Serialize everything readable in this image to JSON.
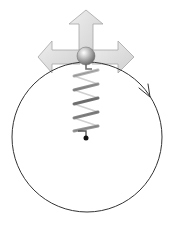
{
  "diagram": {
    "type": "physics-illustration",
    "description_elements": [
      "circular-path",
      "direction-arrowhead",
      "up-arrow",
      "left-arrow",
      "right-arrow",
      "ball",
      "spring",
      "anchor-point"
    ],
    "circle": {
      "cx": 87,
      "cy": 137,
      "r": 75,
      "stroke": "#333333",
      "direction": "clockwise"
    },
    "direction_arrowhead": {
      "x": 150,
      "y": 96,
      "position": "upper-right"
    },
    "arrows": [
      {
        "name": "up",
        "fill": "#d9d9d9",
        "stroke": "#a6a6a6"
      },
      {
        "name": "left",
        "fill": "#d9d9d9",
        "stroke": "#a6a6a6"
      },
      {
        "name": "right",
        "fill": "#d9d9d9",
        "stroke": "#a6a6a6"
      }
    ],
    "ball": {
      "cx": 86,
      "cy": 56,
      "r": 9,
      "color": "#8c8c8c"
    },
    "spring": {
      "x": 86,
      "top": 65,
      "bottom": 131,
      "coils": 6,
      "color": "#7a7a7a"
    },
    "anchor": {
      "cx": 86,
      "cy": 138,
      "r": 2.5,
      "color": "#111111"
    }
  }
}
